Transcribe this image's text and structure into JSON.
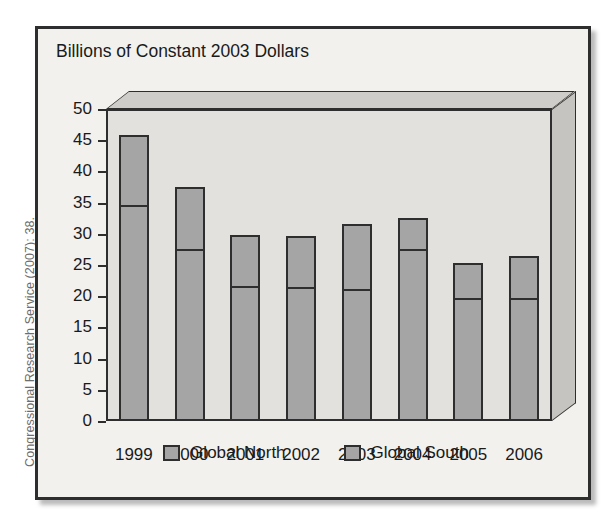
{
  "side_caption": "Congressional Research Service (2007): 38.",
  "chart_title": "Billions of Constant 2003 Dollars",
  "legend": {
    "items": [
      {
        "label": "Global North",
        "swatch": "legend-swatch-north"
      },
      {
        "label": "Global South",
        "swatch": "legend-swatch-south"
      }
    ]
  },
  "colors": {
    "bar_fill": "#a5a5a5",
    "bar_outline": "#2e2e2e",
    "plot_background": "#e3e1dd",
    "frame_background": "#f2f1ee",
    "caption_text": "#6d6d6d"
  },
  "chart_data": {
    "type": "bar",
    "subtype": "stacked-column-3d",
    "title": "Billions of Constant 2003 Dollars",
    "xlabel": "",
    "ylabel": "Billions of Constant 2003 Dollars",
    "ylim": [
      0,
      50
    ],
    "ytick_step": 5,
    "yticks": [
      0,
      5,
      10,
      15,
      20,
      25,
      30,
      35,
      40,
      45,
      50
    ],
    "ytick_labels": [
      "0",
      "5",
      "10",
      "15",
      "20",
      "25",
      "30",
      "35",
      "40",
      "45",
      "50"
    ],
    "grid": false,
    "legend_position": "bottom",
    "categories": [
      "1999",
      "2000",
      "2001",
      "2002",
      "2003",
      "2004",
      "2005",
      "2006"
    ],
    "series": [
      {
        "name": "Global South",
        "note": "lower segment of each stacked column",
        "values": [
          34.0,
          27.0,
          21.0,
          20.8,
          20.5,
          27.0,
          19.0,
          19.0
        ]
      },
      {
        "name": "Global North",
        "note": "upper segment of each stacked column",
        "values": [
          11.8,
          10.5,
          8.8,
          8.8,
          11.0,
          5.5,
          6.3,
          7.5
        ]
      }
    ],
    "totals": [
      45.8,
      37.5,
      29.8,
      29.6,
      31.5,
      32.5,
      25.3,
      26.5
    ]
  }
}
